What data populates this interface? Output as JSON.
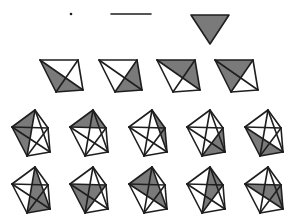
{
  "figure": {
    "colors": {
      "shade": "#7a7a7a",
      "edge": "#1e1e1e",
      "background": "#ffffff"
    },
    "row1": {
      "point": {
        "x": 71,
        "y": 14
      },
      "segment": {
        "x1": 111,
        "y1": 14,
        "x2": 151,
        "y2": 14
      },
      "triangle": [
        [
          191,
          15
        ],
        [
          229,
          15
        ],
        [
          210,
          44
        ]
      ]
    },
    "k4": {
      "base_vertices": [
        [
          0,
          0
        ],
        [
          38,
          0
        ],
        [
          43,
          30
        ],
        [
          16,
          32
        ]
      ],
      "origins": [
        [
          40,
          60
        ],
        [
          99,
          60
        ],
        [
          157,
          60
        ],
        [
          215,
          60
        ]
      ],
      "shaded_triangles": [
        [
          0,
          3,
          2
        ],
        [
          1,
          2,
          3
        ],
        [
          0,
          1,
          2
        ],
        [
          0,
          1,
          3
        ]
      ]
    },
    "k5": {
      "base_vertices": [
        [
          23,
          0
        ],
        [
          0,
          17
        ],
        [
          36,
          18
        ],
        [
          38,
          42
        ],
        [
          15,
          46
        ]
      ],
      "origins": [
        [
          12,
          110
        ],
        [
          70,
          110
        ],
        [
          129,
          110
        ],
        [
          187,
          110
        ],
        [
          245,
          110
        ],
        [
          12,
          167
        ],
        [
          70,
          167
        ],
        [
          129,
          167
        ],
        [
          187,
          167
        ],
        [
          245,
          167
        ]
      ],
      "shaded_triangles": [
        [
          0,
          1,
          4
        ],
        [
          0,
          1,
          2
        ],
        [
          0,
          2,
          3
        ],
        [
          2,
          3,
          4
        ],
        [
          1,
          3,
          4
        ],
        [
          0,
          3,
          4
        ],
        [
          1,
          2,
          4
        ],
        [
          0,
          1,
          3
        ],
        [
          0,
          2,
          4
        ],
        [
          1,
          2,
          3
        ]
      ]
    }
  }
}
